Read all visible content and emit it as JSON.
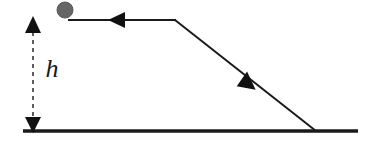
{
  "diagram": {
    "background_color": "#ffffff",
    "stroke_color": "#1a1a1a",
    "labels": {
      "height_label": "h"
    },
    "elements": {
      "ball": {
        "name": "ball",
        "shape": "circle",
        "color": "#666666",
        "outline_color": "#5a5a5a",
        "center_x": 65,
        "center_y": 10,
        "radius": 8
      },
      "ground_line": {
        "name": "ground-line",
        "x1": 23,
        "y1": 131,
        "x2": 358,
        "y2": 131,
        "thickness": 3.5
      },
      "top_track": {
        "name": "horizontal-track",
        "x1": 68,
        "y1": 20,
        "x2": 175,
        "y2": 20,
        "thickness": 2
      },
      "ramp": {
        "name": "inclined-ramp",
        "x1": 175,
        "y1": 20,
        "x2": 316,
        "y2": 131,
        "thickness": 2
      },
      "track_arrow": {
        "name": "track-direction-arrow",
        "direction": "left",
        "tip_x": 108,
        "tip_y": 20,
        "size": 9
      },
      "ramp_arrow": {
        "name": "ramp-direction-arrow",
        "direction": "down-right",
        "tip_x": 253,
        "tip_y": 88,
        "size": 9
      },
      "height_arrow": {
        "name": "height-dimension-arrow",
        "x": 33,
        "y_top": 19,
        "y_bottom": 131,
        "style": "dashed-double-headed",
        "dash_pattern": "4 4",
        "head_size": 7
      },
      "height_text": {
        "name": "height-label-text",
        "x": 52,
        "y": 76
      }
    }
  }
}
